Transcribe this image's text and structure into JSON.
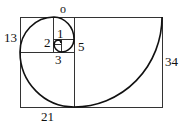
{
  "diagram": {
    "labels": {
      "top": "o",
      "n1": "1",
      "n2": "2",
      "n3": "3",
      "n5": "5",
      "n13": "13",
      "n21": "21",
      "n34": "34"
    },
    "colors": {
      "line": "#222222",
      "background": "#ffffff"
    }
  }
}
